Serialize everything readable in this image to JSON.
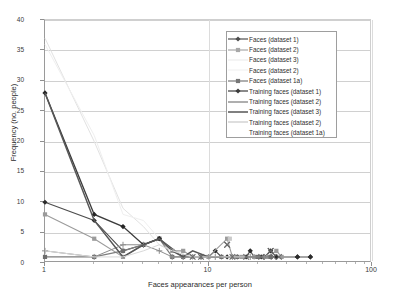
{
  "chart_data": {
    "type": "line",
    "title": "",
    "xlabel": "Faces appearances per person",
    "ylabel": "Frequency (no. people)",
    "xscale": "log",
    "xlim": [
      1,
      100
    ],
    "ylim": [
      0,
      40
    ],
    "xticks": [
      "1",
      "10",
      "100"
    ],
    "yticks": [
      "0",
      "5",
      "10",
      "15",
      "20",
      "25",
      "30",
      "35",
      "40"
    ],
    "grid": true,
    "legend_position": "top-right",
    "series": [
      {
        "name": "Faces (dataset 1)",
        "color": "#4d4d4d",
        "marker": "diamond",
        "marker_color": "#2b2b2b",
        "line_width": 1.1,
        "points": [
          [
            1,
            10
          ],
          [
            2,
            7
          ],
          [
            3,
            2
          ],
          [
            4,
            3
          ],
          [
            5,
            4
          ],
          [
            7,
            1
          ],
          [
            8,
            1
          ],
          [
            9,
            1
          ],
          [
            10,
            1
          ],
          [
            11,
            2
          ],
          [
            12,
            1
          ],
          [
            13,
            1
          ],
          [
            15,
            1
          ],
          [
            17,
            1
          ],
          [
            18,
            2
          ],
          [
            19,
            1
          ],
          [
            21,
            1
          ],
          [
            22,
            1
          ],
          [
            24,
            2
          ],
          [
            26,
            1
          ],
          [
            35,
            1
          ],
          [
            42,
            1
          ]
        ]
      },
      {
        "name": "Faces (dataset 2)",
        "color": "#9b9b9b",
        "marker": "square",
        "marker_color": "#9b9b9b",
        "line_width": 1.1,
        "points": [
          [
            1,
            8
          ],
          [
            2,
            4
          ],
          [
            3,
            1
          ],
          [
            4,
            3
          ],
          [
            5,
            4
          ],
          [
            6,
            2
          ],
          [
            7,
            2
          ],
          [
            8,
            1
          ],
          [
            10,
            1
          ],
          [
            13,
            4
          ],
          [
            14,
            1
          ],
          [
            16,
            1
          ],
          [
            19,
            1
          ],
          [
            23,
            1
          ],
          [
            26,
            2
          ],
          [
            28,
            1
          ]
        ]
      },
      {
        "name": "Faces (dataset 3)",
        "color": "#e2e2e2",
        "marker": "none",
        "marker_color": "#e2e2e2",
        "line_width": 1.0,
        "points": [
          [
            1,
            37
          ],
          [
            2,
            20
          ],
          [
            3,
            9
          ],
          [
            4,
            6
          ],
          [
            5,
            3
          ],
          [
            6,
            2
          ],
          [
            7,
            1
          ],
          [
            9,
            1
          ],
          [
            12,
            1
          ]
        ]
      },
      {
        "name": "Faces (dataset 2)",
        "color": "#efefef",
        "marker": "none",
        "marker_color": "#efefef",
        "line_width": 1.0,
        "points": [
          [
            1,
            36
          ],
          [
            2,
            21
          ],
          [
            3,
            8
          ],
          [
            4,
            7
          ],
          [
            5,
            4
          ],
          [
            6,
            2
          ],
          [
            8,
            1
          ],
          [
            11,
            1
          ]
        ]
      },
      {
        "name": "Faces (dataset 1a)",
        "color": "#7d7d7d",
        "marker": "square",
        "marker_color": "#6e6e6e",
        "line_width": 1.2,
        "points": [
          [
            1,
            1
          ],
          [
            2,
            1
          ],
          [
            3,
            2
          ],
          [
            4,
            3
          ],
          [
            5,
            4
          ],
          [
            6,
            1
          ],
          [
            7,
            1
          ],
          [
            9,
            1
          ],
          [
            12,
            1
          ],
          [
            15,
            1
          ],
          [
            20,
            1
          ],
          [
            24,
            1
          ]
        ]
      },
      {
        "name": "Training faces (dataset 1)",
        "color": "#3c3c3c",
        "marker": "diamond",
        "marker_color": "#262626",
        "line_width": 1.3,
        "points": [
          [
            1,
            28
          ],
          [
            2,
            8
          ],
          [
            3,
            6
          ],
          [
            4,
            3
          ],
          [
            5,
            4
          ]
        ]
      },
      {
        "name": "Training faces (dataset 2)",
        "color": "#8d8d8d",
        "marker": "plus",
        "marker_color": "#8d8d8d",
        "line_width": 1.0,
        "points": [
          [
            1,
            2
          ],
          [
            2,
            1
          ],
          [
            3,
            3
          ],
          [
            4,
            3
          ],
          [
            5,
            2
          ],
          [
            6,
            1
          ],
          [
            7,
            1
          ],
          [
            9,
            1
          ],
          [
            11,
            1
          ],
          [
            14,
            1
          ],
          [
            18,
            1
          ],
          [
            22,
            1
          ]
        ]
      },
      {
        "name": "Training faces (dataset 3)",
        "color": "#575757",
        "marker": "none",
        "marker_color": "#575757",
        "line_width": 1.5,
        "points": [
          [
            1,
            28
          ],
          [
            2,
            7
          ],
          [
            3,
            1
          ],
          [
            4,
            3
          ],
          [
            5,
            4
          ],
          [
            6,
            2
          ],
          [
            7,
            1
          ],
          [
            8,
            2
          ],
          [
            10,
            1
          ],
          [
            12,
            1
          ]
        ]
      },
      {
        "name": "Training faces (dataset 2)",
        "color": "#d8d8d8",
        "marker": "none",
        "marker_color": "#d8d8d8",
        "line_width": 1.0,
        "points": [
          [
            1,
            2
          ],
          [
            2,
            1
          ],
          [
            3,
            1
          ],
          [
            4,
            2
          ],
          [
            5,
            3
          ],
          [
            6,
            2
          ],
          [
            8,
            1
          ],
          [
            10,
            1
          ],
          [
            13,
            1
          ],
          [
            17,
            1
          ]
        ]
      },
      {
        "name": "Training faces (dataset 1a)",
        "color": "#bdbdbd",
        "marker": "cross",
        "marker_color": "#6b6b6b",
        "line_width": 0,
        "points": [
          [
            8,
            1
          ],
          [
            9,
            1
          ],
          [
            13,
            3
          ],
          [
            14,
            1
          ],
          [
            17,
            1
          ],
          [
            21,
            1
          ],
          [
            24,
            2
          ],
          [
            25,
            1
          ],
          [
            27,
            1
          ]
        ]
      }
    ],
    "extra_markers": [
      {
        "x": 13,
        "y": 3,
        "marker": "cross",
        "color": "#6b6b6b"
      },
      {
        "x": 13.5,
        "y": 4,
        "marker": "square",
        "color": "#c9c9c9"
      },
      {
        "x": 24,
        "y": 2,
        "marker": "cross",
        "color": "#5f5f5f"
      },
      {
        "x": 35,
        "y": 1,
        "marker": "diamond",
        "color": "#2b2b2b"
      },
      {
        "x": 42,
        "y": 1,
        "marker": "diamond",
        "color": "#2b2b2b"
      }
    ]
  },
  "legend": {
    "items": [
      {
        "label": "Faces (dataset 1)",
        "color": "#4d4d4d",
        "marker": "diamond",
        "has_line": true
      },
      {
        "label": "Faces (dataset 2)",
        "color": "#a8a8a8",
        "marker": "square",
        "has_line": true
      },
      {
        "label": "Faces (dataset 3)",
        "color": "#efefef",
        "marker": "none",
        "has_line": true
      },
      {
        "label": "Faces (dataset 2)",
        "color": "#f4f4f4",
        "marker": "none",
        "has_line": true
      },
      {
        "label": "Faces (dataset 1a)",
        "color": "#777777",
        "marker": "square",
        "has_line": true
      },
      {
        "label": "Training faces (dataset 1)",
        "color": "#3c3c3c",
        "marker": "diamond",
        "has_line": true
      },
      {
        "label": "Training faces (dataset 2)",
        "color": "#8d8d8d",
        "marker": "none",
        "has_line": true
      },
      {
        "label": "Training faces (dataset 3)",
        "color": "#4a4a4a",
        "marker": "none",
        "has_line": true
      },
      {
        "label": "Training faces (dataset 2)",
        "color": "#d0d0d0",
        "marker": "none",
        "has_line": true
      },
      {
        "label": "Training faces (dataset 1a)",
        "color": "#ffffff",
        "marker": "none",
        "has_line": false
      }
    ]
  }
}
